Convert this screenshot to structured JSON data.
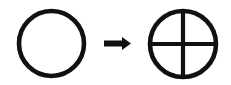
{
  "figure": {
    "title": "Circle transformed into quartered circle",
    "background_color": "#ffffff",
    "stroke_color": "#111111",
    "width": 231,
    "height": 85
  },
  "shapes": {
    "source": {
      "label": "plain circle",
      "icon": "circle-outline-icon",
      "cx": 51.5,
      "cy": 43.5,
      "r": 32.5,
      "stroke_width": 4.6,
      "fill": "none"
    },
    "arrow": {
      "label": "transforms into",
      "icon": "arrow-right-icon",
      "x_start": 104,
      "x_end": 131,
      "y_center": 43.5,
      "shaft_thickness": 6,
      "head_width": 9,
      "head_height": 13
    },
    "target": {
      "label": "quartered circle",
      "icon": "circle-quartered-icon",
      "cx": 183,
      "cy": 44,
      "r": 33,
      "stroke_width": 4.6,
      "fill": "none",
      "divider_vertical": true,
      "divider_horizontal": true,
      "divider_stroke_width": 4.2
    }
  }
}
